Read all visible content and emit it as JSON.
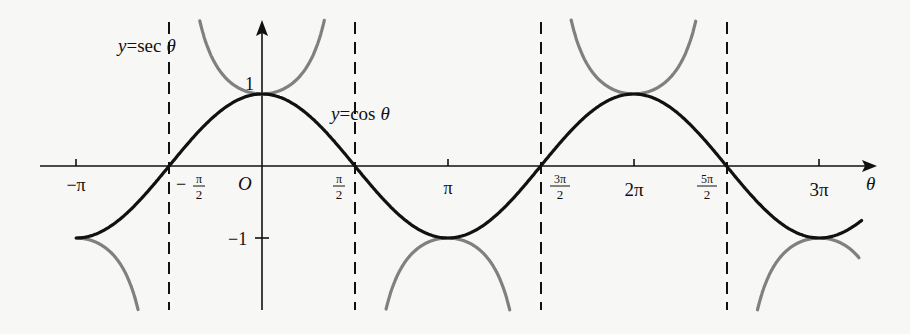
{
  "chart_data": {
    "type": "line",
    "title": "",
    "xlabel": "θ",
    "ylabel": "",
    "xlim_rad": [
      -3.14159,
      3.85
    ],
    "xlim_label": "-π to about 3π + 0.7",
    "ylim": [
      -2,
      2
    ],
    "grid": false,
    "legend": "none (inline curve labels)",
    "x_ticks": [
      {
        "label": "−π",
        "value": -3.14159
      },
      {
        "label": "−π/2",
        "value": -1.5708
      },
      {
        "label": "O",
        "value": 0
      },
      {
        "label": "π/2",
        "value": 1.5708
      },
      {
        "label": "π",
        "value": 3.14159
      },
      {
        "label": "3π/2",
        "value": 4.7124
      },
      {
        "label": "2π",
        "value": 6.2832
      },
      {
        "label": "5π/2",
        "value": 7.854
      },
      {
        "label": "3π",
        "value": 9.4248
      }
    ],
    "y_ticks": [
      {
        "label": "1",
        "value": 1
      },
      {
        "label": "−1",
        "value": -1
      }
    ],
    "vertical_asymptotes": [
      "−π/2",
      "π/2",
      "3π/2",
      "5π/2"
    ],
    "series": [
      {
        "name": "y = cos θ",
        "color": "#111111",
        "style": "solid",
        "x": [
          -3.14159,
          -1.5708,
          0,
          1.5708,
          3.14159,
          4.7124,
          6.2832,
          7.854,
          9.4248,
          10.1
        ],
        "values": [
          -1,
          0,
          1,
          0,
          -1,
          0,
          1,
          0,
          -1,
          -0.78
        ]
      },
      {
        "name": "y = sec θ",
        "color": "#808080",
        "style": "solid",
        "x": [
          -3.14159,
          -2.1,
          0,
          1.06,
          2.1,
          3.14159,
          4.2,
          5.2,
          6.2832,
          7.35,
          8.4,
          9.4248,
          10.1
        ],
        "values": [
          -1,
          -1.98,
          1,
          2.03,
          -1.98,
          -1,
          -2.0,
          2.1,
          1,
          2.05,
          -1.9,
          -1,
          -1.28
        ]
      }
    ]
  },
  "labels": {
    "sec_label_y": "y",
    "sec_label_eq": "=",
    "sec_label_fn": "sec",
    "sec_label_var": "θ",
    "cos_label_y": "y",
    "cos_label_eq": "=",
    "cos_label_fn": "cos",
    "cos_label_var": "θ",
    "axis_theta": "θ",
    "origin": "O",
    "y_one": "1",
    "y_neg_one": "−1",
    "neg_pi": "−π",
    "neg_half_pi_num": "π",
    "neg_half_pi_den": "2",
    "neg_half_pi_sign": "−",
    "half_pi_num": "π",
    "half_pi_den": "2",
    "pi": "π",
    "three_half_pi_num": "3π",
    "three_half_pi_den": "2",
    "two_pi": "2π",
    "five_half_pi_num": "5π",
    "five_half_pi_den": "2",
    "three_pi": "3π"
  }
}
